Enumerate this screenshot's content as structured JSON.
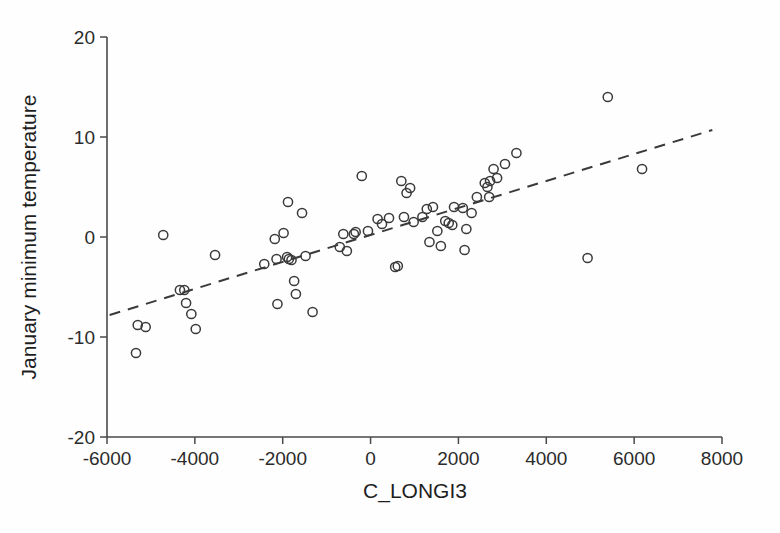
{
  "chart_data": {
    "type": "scatter",
    "title": "",
    "xlabel": "C_LONGI3",
    "ylabel": "January minimum temperature",
    "xlim": [
      -6000,
      8000
    ],
    "ylim": [
      -20,
      20
    ],
    "xticks": [
      -6000,
      -4000,
      -2000,
      0,
      2000,
      4000,
      6000,
      8000
    ],
    "yticks": [
      20,
      10,
      0,
      -10,
      -20
    ],
    "xtick_labels": [
      "-6000",
      "-4000",
      "-2000",
      "0",
      "2000",
      "4000",
      "6000",
      "8000"
    ],
    "ytick_labels": [
      "20",
      "10",
      "0",
      "-10",
      "-20"
    ],
    "grid": false,
    "legend": null,
    "marker": "open-circle",
    "marker_color": "#3a3a3a",
    "points": [
      [
        -5340,
        -11.6
      ],
      [
        -5300,
        -8.8
      ],
      [
        -5120,
        -9.0
      ],
      [
        -4720,
        0.2
      ],
      [
        -4340,
        -5.3
      ],
      [
        -4240,
        -5.3
      ],
      [
        -4200,
        -6.6
      ],
      [
        -4080,
        -7.7
      ],
      [
        -3980,
        -9.2
      ],
      [
        -3540,
        -1.8
      ],
      [
        -2420,
        -2.7
      ],
      [
        -2180,
        -0.2
      ],
      [
        -2140,
        -2.2
      ],
      [
        -2120,
        -6.7
      ],
      [
        -1980,
        0.4
      ],
      [
        -1900,
        -2.0
      ],
      [
        -1880,
        3.5
      ],
      [
        -1860,
        -2.2
      ],
      [
        -1800,
        -2.3
      ],
      [
        -1740,
        -4.4
      ],
      [
        -1700,
        -5.7
      ],
      [
        -1560,
        2.4
      ],
      [
        -1480,
        -1.9
      ],
      [
        -1320,
        -7.5
      ],
      [
        -700,
        -1.0
      ],
      [
        -620,
        0.3
      ],
      [
        -540,
        -1.4
      ],
      [
        -380,
        0.3
      ],
      [
        -340,
        0.5
      ],
      [
        -200,
        6.1
      ],
      [
        -60,
        0.6
      ],
      [
        160,
        1.8
      ],
      [
        260,
        1.3
      ],
      [
        420,
        1.9
      ],
      [
        560,
        -3.0
      ],
      [
        620,
        -2.9
      ],
      [
        700,
        5.6
      ],
      [
        760,
        2.0
      ],
      [
        820,
        4.4
      ],
      [
        900,
        4.9
      ],
      [
        980,
        1.5
      ],
      [
        1180,
        2.0
      ],
      [
        1280,
        2.8
      ],
      [
        1340,
        -0.5
      ],
      [
        1420,
        3.0
      ],
      [
        1520,
        0.6
      ],
      [
        1600,
        -0.9
      ],
      [
        1700,
        1.6
      ],
      [
        1780,
        1.4
      ],
      [
        1860,
        1.2
      ],
      [
        1900,
        3.0
      ],
      [
        2100,
        2.9
      ],
      [
        2140,
        -1.3
      ],
      [
        2180,
        0.8
      ],
      [
        2300,
        2.4
      ],
      [
        2420,
        4.0
      ],
      [
        2600,
        5.4
      ],
      [
        2660,
        5.0
      ],
      [
        2700,
        4.0
      ],
      [
        2720,
        5.6
      ],
      [
        2800,
        6.8
      ],
      [
        2880,
        5.9
      ],
      [
        3060,
        7.3
      ],
      [
        3320,
        8.4
      ],
      [
        4940,
        -2.1
      ],
      [
        5400,
        14.0
      ],
      [
        6180,
        6.8
      ]
    ],
    "trendline": {
      "style": "dashed",
      "x": [
        -5940,
        7780
      ],
      "y": [
        -7.8,
        10.7
      ]
    }
  }
}
